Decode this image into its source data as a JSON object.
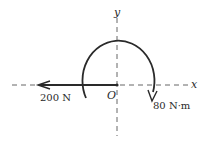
{
  "diagram": {
    "axes": {
      "x_label": "x",
      "y_label": "y",
      "origin_label": "O"
    },
    "force": {
      "label": "200 N",
      "direction": "negative-x"
    },
    "moment": {
      "label": "80 N·m",
      "direction": "clockwise"
    },
    "colors": {
      "ink": "#2a2a2a",
      "axis": "#555555",
      "background": "#ffffff"
    }
  }
}
